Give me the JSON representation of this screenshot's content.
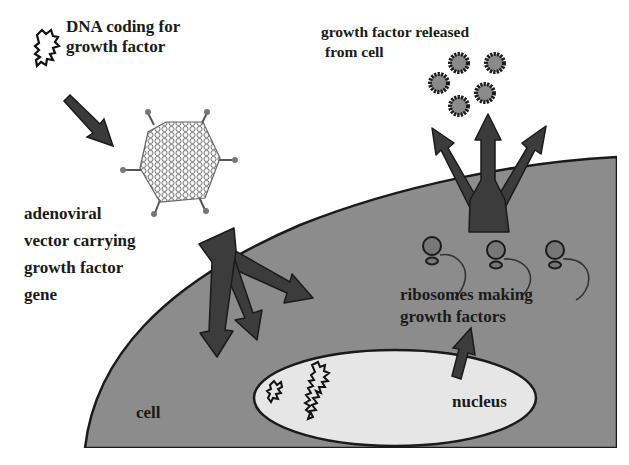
{
  "diagram": {
    "type": "biology-schematic",
    "colors": {
      "background": "#ffffff",
      "cell_fill": "#8c8c8c",
      "cell_outline": "#1a1a1a",
      "nucleus_fill": "#e6e6e6",
      "arrow_fill": "#3f3f3f",
      "growth_factor_fill": "#8a8a8a",
      "text": "#1a1a1a"
    },
    "labels": {
      "dna": [
        "DNA coding for",
        "growth factor"
      ],
      "released": [
        "growth factor released",
        "from cell"
      ],
      "vector": [
        "adenoviral",
        "vector carrying",
        "growth factor",
        "gene"
      ],
      "ribosomes": [
        "ribosomes making",
        "growth factors"
      ],
      "cell": "cell",
      "nucleus": "nucleus"
    },
    "elements": {
      "growth_factor_particles": 5,
      "ribosomes": 3,
      "dna_strands_in_nucleus": 2
    }
  }
}
